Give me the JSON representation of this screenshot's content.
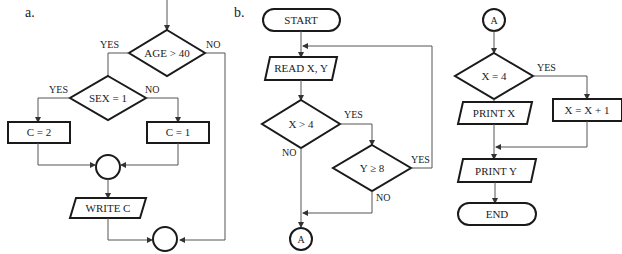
{
  "part_labels": {
    "a": "a.",
    "b": "b."
  },
  "flowchart_a": {
    "decision_age": "AGE > 40",
    "decision_age_yes": "YES",
    "decision_age_no": "NO",
    "decision_sex": "SEX = 1",
    "decision_sex_yes": "YES",
    "decision_sex_no": "NO",
    "process_c2": "C = 2",
    "process_c1": "C = 1",
    "output_write": "WRITE C"
  },
  "flowchart_b": {
    "start": "START",
    "input_read": "READ X, Y",
    "decision_x": "X > 4",
    "decision_x_yes": "YES",
    "decision_x_no": "NO",
    "decision_y": "Y ≥ 8",
    "decision_y_yes": "YES",
    "decision_y_no": "NO",
    "connector_out": "A"
  },
  "flowchart_b_cont": {
    "connector_in": "A",
    "decision_x4": "X = 4",
    "decision_x4_yes": "YES",
    "decision_x4_no": "NO",
    "process_inc": "X = X + 1",
    "output_print_x": "PRINT X",
    "output_print_y": "PRINT Y",
    "end": "END"
  },
  "colors": {
    "stroke": "#1a1a1a",
    "connector": "#555555",
    "background": "#ffffff"
  }
}
